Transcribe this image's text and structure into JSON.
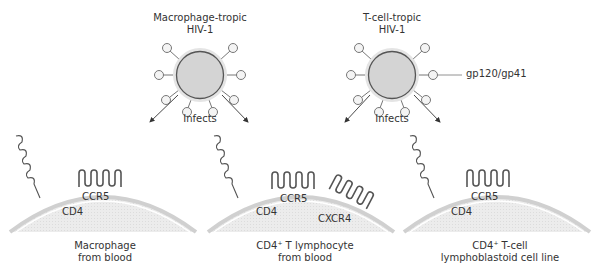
{
  "viruses": [
    {
      "title_line1": "Macrophage-tropic",
      "title_line2": "HIV-1",
      "action": "Infects"
    },
    {
      "title_line1": "T-cell-tropic",
      "title_line2": "HIV-1",
      "action": "Infects",
      "spike_label": "gp120/gp41"
    }
  ],
  "cells": [
    {
      "receptors": [
        "CD4",
        "CCR5"
      ],
      "caption_line1": "Macrophage",
      "caption_line2": "from blood"
    },
    {
      "receptors": [
        "CD4",
        "CCR5",
        "CXCR4"
      ],
      "caption_line1_prefix": "CD4",
      "caption_line1_sup": "+",
      "caption_line1_suffix": " T lymphocyte",
      "caption_line2": "from blood"
    },
    {
      "receptors": [
        "CD4",
        "CCR5"
      ],
      "caption_line1_prefix": "CD4",
      "caption_line1_sup": "+",
      "caption_line1_suffix": " T-cell",
      "caption_line2": "lymphoblastoid cell line"
    }
  ],
  "colors": {
    "virus_fill": "#d6d6d6",
    "virus_halo": "#e6e6e6",
    "virus_outline": "#555555",
    "cell_fill": "#ececec",
    "cell_membrane": "#d2d2d2",
    "receptor_stroke": "#555555",
    "arrow": "#333333"
  }
}
